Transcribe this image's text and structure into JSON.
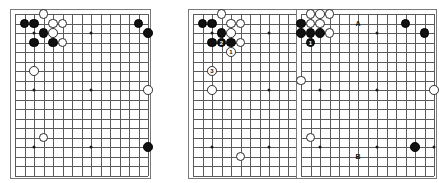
{
  "page": {
    "background": "#ffffff",
    "width": 436,
    "height": 183
  },
  "colors": {
    "black_stone": "#111111",
    "white_stone": "#ffffff",
    "grid_line": "#5b5b5b",
    "board_border": "#7a7a7a",
    "star_point": "#1a1a1a",
    "label_text": "#111111"
  },
  "boards": [
    {
      "id": "diagram-1",
      "caption": "",
      "x": 10,
      "y": 9,
      "cols": 15,
      "rows": 18,
      "spacing": 9.5,
      "margin": 4,
      "stars": [
        {
          "col": 2,
          "row": 2
        },
        {
          "col": 8,
          "row": 2
        },
        {
          "col": 2,
          "row": 8
        },
        {
          "col": 8,
          "row": 8
        },
        {
          "col": 14,
          "row": 8
        },
        {
          "col": 8,
          "row": 14
        },
        {
          "col": 14,
          "row": 14
        },
        {
          "col": 2,
          "row": 14
        }
      ],
      "stones": [
        {
          "col": 3,
          "row": 0,
          "color": "white",
          "label": ""
        },
        {
          "col": 1,
          "row": 1,
          "color": "black",
          "label": ""
        },
        {
          "col": 2,
          "row": 1,
          "color": "black",
          "label": ""
        },
        {
          "col": 4,
          "row": 1,
          "color": "white",
          "label": ""
        },
        {
          "col": 5,
          "row": 1,
          "color": "white",
          "label": ""
        },
        {
          "col": 3,
          "row": 2,
          "color": "black",
          "label": ""
        },
        {
          "col": 4,
          "row": 2,
          "color": "white",
          "label": ""
        },
        {
          "col": 2,
          "row": 3,
          "color": "black",
          "label": ""
        },
        {
          "col": 4,
          "row": 3,
          "color": "black",
          "label": ""
        },
        {
          "col": 5,
          "row": 3,
          "color": "white",
          "label": ""
        },
        {
          "col": 2,
          "row": 6,
          "color": "white",
          "label": ""
        },
        {
          "col": 13,
          "row": 1,
          "color": "black",
          "label": ""
        },
        {
          "col": 14,
          "row": 2,
          "color": "black",
          "label": ""
        },
        {
          "col": 14,
          "row": 8,
          "color": "white",
          "label": ""
        },
        {
          "col": 3,
          "row": 13,
          "color": "white",
          "label": ""
        },
        {
          "col": 14,
          "row": 14,
          "color": "black",
          "label": ""
        }
      ],
      "point_labels": []
    },
    {
      "id": "diagram-2",
      "caption": "",
      "x": 188,
      "y": 9,
      "cols": 15,
      "rows": 18,
      "spacing": 9.5,
      "margin": 4,
      "stars": [
        {
          "col": 2,
          "row": 2
        },
        {
          "col": 8,
          "row": 2
        },
        {
          "col": 2,
          "row": 8
        },
        {
          "col": 8,
          "row": 8
        },
        {
          "col": 14,
          "row": 8
        },
        {
          "col": 8,
          "row": 14
        },
        {
          "col": 2,
          "row": 14
        },
        {
          "col": 14,
          "row": 14
        }
      ],
      "stones": [
        {
          "col": 3,
          "row": 0,
          "color": "white",
          "label": ""
        },
        {
          "col": 1,
          "row": 1,
          "color": "black",
          "label": ""
        },
        {
          "col": 2,
          "row": 1,
          "color": "black",
          "label": ""
        },
        {
          "col": 4,
          "row": 1,
          "color": "white",
          "label": ""
        },
        {
          "col": 5,
          "row": 1,
          "color": "white",
          "label": ""
        },
        {
          "col": 3,
          "row": 2,
          "color": "black",
          "label": ""
        },
        {
          "col": 4,
          "row": 2,
          "color": "white",
          "label": ""
        },
        {
          "col": 2,
          "row": 3,
          "color": "black",
          "label": ""
        },
        {
          "col": 3,
          "row": 3,
          "color": "black",
          "label": "2"
        },
        {
          "col": 4,
          "row": 3,
          "color": "black",
          "label": ""
        },
        {
          "col": 5,
          "row": 3,
          "color": "white",
          "label": ""
        },
        {
          "col": 4,
          "row": 4,
          "color": "white",
          "label": "1"
        },
        {
          "col": 2,
          "row": 6,
          "color": "white",
          "label": "3"
        },
        {
          "col": 2,
          "row": 8,
          "color": "white",
          "label": ""
        },
        {
          "col": 5,
          "row": 15,
          "color": "white",
          "label": ""
        }
      ],
      "point_labels": []
    },
    {
      "id": "diagram-3",
      "caption": "",
      "x": 296,
      "y": 9,
      "cols": 15,
      "rows": 18,
      "spacing": 9.5,
      "margin": 4,
      "stars": [
        {
          "col": 2,
          "row": 2
        },
        {
          "col": 8,
          "row": 2
        },
        {
          "col": 2,
          "row": 8
        },
        {
          "col": 8,
          "row": 8
        },
        {
          "col": 14,
          "row": 8
        },
        {
          "col": 8,
          "row": 14
        },
        {
          "col": 2,
          "row": 14
        },
        {
          "col": 14,
          "row": 14
        }
      ],
      "stones": [
        {
          "col": 1,
          "row": 0,
          "color": "white",
          "label": ""
        },
        {
          "col": 2,
          "row": 0,
          "color": "white",
          "label": ""
        },
        {
          "col": 3,
          "row": 0,
          "color": "white",
          "label": ""
        },
        {
          "col": 0,
          "row": 1,
          "color": "black",
          "label": ""
        },
        {
          "col": 1,
          "row": 1,
          "color": "white",
          "label": ""
        },
        {
          "col": 2,
          "row": 1,
          "color": "white",
          "label": ""
        },
        {
          "col": 0,
          "row": 2,
          "color": "black",
          "label": ""
        },
        {
          "col": 1,
          "row": 2,
          "color": "black",
          "label": ""
        },
        {
          "col": 2,
          "row": 2,
          "color": "black",
          "label": ""
        },
        {
          "col": 3,
          "row": 2,
          "color": "white",
          "label": ""
        },
        {
          "col": 1,
          "row": 3,
          "color": "black",
          "label": "1"
        },
        {
          "col": 0,
          "row": 7,
          "color": "white",
          "label": ""
        },
        {
          "col": 11,
          "row": 1,
          "color": "black",
          "label": ""
        },
        {
          "col": 13,
          "row": 2,
          "color": "black",
          "label": ""
        },
        {
          "col": 14,
          "row": 8,
          "color": "white",
          "label": ""
        },
        {
          "col": 1,
          "row": 13,
          "color": "white",
          "label": ""
        },
        {
          "col": 12,
          "row": 14,
          "color": "black",
          "label": ""
        }
      ],
      "point_labels": [
        {
          "col": 6,
          "row": 1,
          "text": "A"
        },
        {
          "col": 6,
          "row": 15,
          "text": "B"
        }
      ]
    }
  ]
}
